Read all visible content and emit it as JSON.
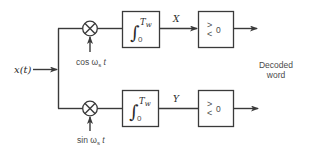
{
  "diagram": {
    "input": {
      "label": "x(t)"
    },
    "branches": [
      {
        "id": "top",
        "reference": {
          "label": "cos ω",
          "subscript": "s",
          "suffix": " t",
          "full": "cos ωs t"
        },
        "integrator": {
          "symbol": "∫",
          "upper": "T",
          "upper_sub": "w",
          "lower": "0"
        },
        "output_label": "X",
        "comparator": {
          "symbol_top": ">",
          "symbol_bottom": "<",
          "threshold": "0"
        }
      },
      {
        "id": "bottom",
        "reference": {
          "label": "sin ω",
          "subscript": "s",
          "suffix": " t",
          "full": "sin ωs t"
        },
        "integrator": {
          "symbol": "∫",
          "upper": "T",
          "upper_sub": "w",
          "lower": "0"
        },
        "output_label": "Y",
        "comparator": {
          "symbol_top": ">",
          "symbol_bottom": "<",
          "threshold": "0"
        }
      }
    ],
    "output": {
      "line1": "Decoded",
      "line2": "word"
    },
    "colors": {
      "stroke": "#3a3a3a",
      "text": "#2a2a2a",
      "background": "#ffffff"
    }
  }
}
